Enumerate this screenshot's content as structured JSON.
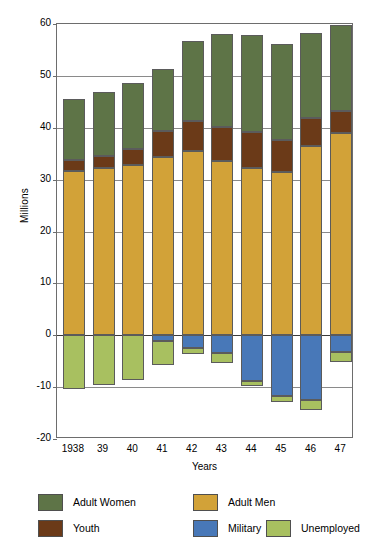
{
  "chart_data": {
    "type": "bar",
    "title": "",
    "subtitle": "",
    "xlabel": "Years",
    "ylabel": "Millions",
    "categories": [
      "1938",
      "39",
      "40",
      "41",
      "42",
      "43",
      "44",
      "45",
      "46",
      "47"
    ],
    "ylim": [
      -20,
      60
    ],
    "yticks": [
      -20,
      -10,
      0,
      10,
      20,
      30,
      40,
      50,
      60
    ],
    "ytick_labels": [
      "-20",
      "-10",
      "0",
      "10",
      "20",
      "30",
      "40",
      "50",
      "60"
    ],
    "grid": true,
    "stacked": true,
    "legend_position": "bottom",
    "series": [
      {
        "name": "Adult Women",
        "color": "#5e7447",
        "sign": "positive",
        "values": [
          11.7,
          12.3,
          12.8,
          12.0,
          15.4,
          18.0,
          18.7,
          18.4,
          16.4,
          16.6
        ]
      },
      {
        "name": "Youth",
        "color": "#6b3a18",
        "sign": "positive",
        "values": [
          2.2,
          2.3,
          3.0,
          5.0,
          5.8,
          6.5,
          6.8,
          6.2,
          5.4,
          4.2
        ]
      },
      {
        "name": "Adult Men",
        "color": "#d2a238",
        "sign": "positive",
        "values": [
          31.6,
          32.3,
          32.9,
          34.3,
          35.5,
          33.6,
          32.3,
          31.5,
          36.5,
          39.0
        ]
      },
      {
        "name": "Military",
        "color": "#4878b8",
        "sign": "negative",
        "values": [
          0.0,
          0.0,
          0.0,
          1.2,
          2.5,
          3.5,
          8.8,
          11.7,
          12.4,
          3.3
        ]
      },
      {
        "name": "Unemployed",
        "color": "#a8c060",
        "sign": "negative",
        "values": [
          10.4,
          9.5,
          8.7,
          4.6,
          1.2,
          1.9,
          1.0,
          1.1,
          2.0,
          1.8
        ]
      }
    ],
    "totals_positive": [
      45.5,
      46.9,
      48.7,
      51.3,
      56.7,
      58.1,
      57.8,
      56.1,
      58.3,
      59.8
    ],
    "totals_negative": [
      10.4,
      9.5,
      8.7,
      5.8,
      3.7,
      5.4,
      9.8,
      12.8,
      14.4,
      5.1
    ]
  },
  "legend": {
    "items": [
      {
        "label": "Adult Women",
        "color": "#5e7447"
      },
      {
        "label": "Adult Men",
        "color": "#d2a238"
      },
      {
        "label": "Youth",
        "color": "#6b3a18"
      },
      {
        "label": "Military",
        "color": "#4878b8"
      },
      {
        "label": "Unemployed",
        "color": "#a8c060"
      }
    ]
  }
}
